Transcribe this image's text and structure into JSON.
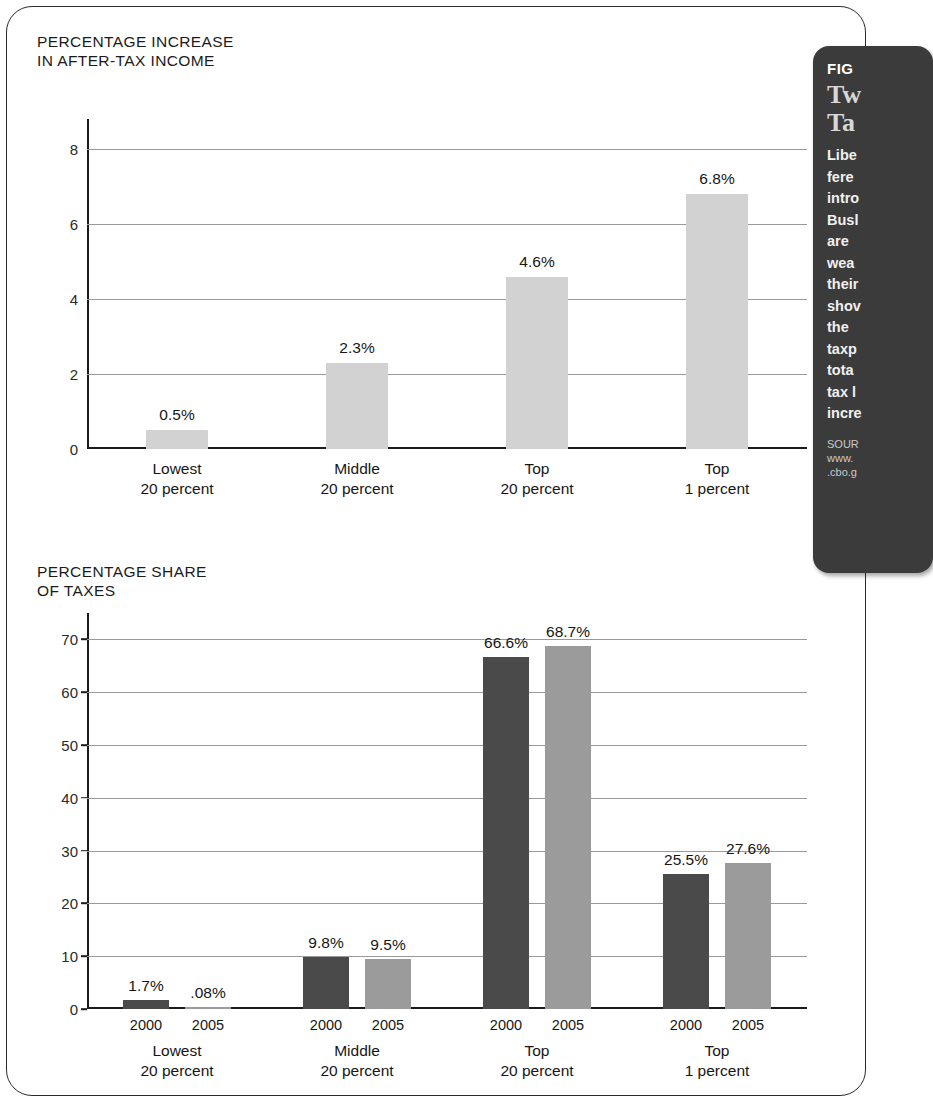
{
  "sidebar": {
    "figure_label": "FIG",
    "title": "Tw\nTa",
    "body": "Libe\nfere\nintro\nBusl\nare\nwea\ntheir\nshov\nthe\ntaxp\ntota\ntax l\nincre",
    "source": "SOUR\nwww.\n.cbo.g"
  },
  "chart_data": [
    {
      "id": "top",
      "type": "bar",
      "title": "PERCENTAGE INCREASE\nIN AFTER-TAX INCOME",
      "categories": [
        "Lowest\n20 percent",
        "Middle\n20 percent",
        "Top\n20 percent",
        "Top\n1 percent"
      ],
      "values": [
        0.5,
        2.3,
        4.6,
        6.8
      ],
      "value_labels": [
        "0.5%",
        "2.3%",
        "4.6%",
        "6.8%"
      ],
      "yticks": [
        0,
        2,
        4,
        6,
        8
      ],
      "ytick_labels": [
        "0",
        "2",
        "4",
        "6",
        "8"
      ],
      "ylim": [
        0,
        8.8
      ],
      "xlabel": "",
      "ylabel": "",
      "grid": true,
      "legend": "none",
      "bar_color": "#d2d2d2"
    },
    {
      "id": "bottom",
      "type": "bar",
      "title": "PERCENTAGE SHARE\nOF TAXES",
      "categories": [
        "Lowest\n20 percent",
        "Middle\n20 percent",
        "Top\n20 percent",
        "Top\n1 percent"
      ],
      "series": [
        {
          "name": "2000",
          "values": [
            1.7,
            9.8,
            66.6,
            25.5
          ],
          "labels": [
            "1.7%",
            "9.8%",
            "66.6%",
            "25.5%"
          ],
          "color": "#4a4a4a"
        },
        {
          "name": "2005",
          "values": [
            0.08,
            9.5,
            68.7,
            27.6
          ],
          "labels": [
            ".08%",
            "9.5%",
            "68.7%",
            "27.6%"
          ],
          "color": "#9b9b9b"
        }
      ],
      "yticks": [
        0,
        10,
        20,
        30,
        40,
        50,
        60,
        70
      ],
      "ytick_labels": [
        "0",
        "10",
        "20",
        "30",
        "40",
        "50",
        "60",
        "70"
      ],
      "ylim": [
        0,
        75
      ],
      "xlabel": "",
      "ylabel": "",
      "grid": true,
      "legend": "inline-axis"
    }
  ]
}
